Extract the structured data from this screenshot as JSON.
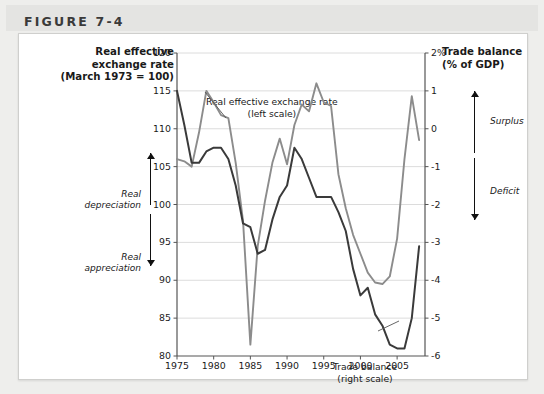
{
  "figure": {
    "label": "FIGURE 7-4"
  },
  "axis_titles": {
    "left_line1": "Real effective",
    "left_line2": "exchange rate",
    "left_line3": "(March 1973 = 100)",
    "right_line1": "Trade balance",
    "right_line2": "(% of GDP)"
  },
  "annotations": {
    "real_depreciation_line1": "Real",
    "real_depreciation_line2": "depreciation",
    "real_appreciation_line1": "Real",
    "real_appreciation_line2": "appreciation",
    "surplus": "Surplus",
    "deficit": "Deficit",
    "up-arrow-icon": "up-arrow-icon",
    "down-arrow-icon": "down-arrow-icon"
  },
  "callouts": {
    "reer_line1": "Real effective exchange rate",
    "reer_line2": "(left scale)",
    "trade_line1": "Trade balance",
    "trade_line2": "(right scale)"
  },
  "colors": {
    "reer_line": "#8c8c8c",
    "trade_line": "#3a3a3a",
    "gridline": "#dcdcdc",
    "axis": "#555555",
    "card_bg": "#ffffff",
    "page_bg": "#eeeeec",
    "header_bg": "#e4e4e2"
  },
  "chart_data": {
    "type": "line",
    "title": "",
    "xlabel": "",
    "grid": true,
    "legend": "callout-labels",
    "x_ticks": [
      1975,
      1980,
      1985,
      1990,
      1995,
      2000,
      2005
    ],
    "xlim": [
      1975,
      2008.8
    ],
    "left_axis": {
      "label": "Real effective exchange rate (March 1973 = 100)",
      "ylim": [
        80,
        120
      ],
      "ticks": [
        80,
        85,
        90,
        95,
        100,
        105,
        110,
        115,
        120
      ],
      "tick_labels": [
        "80",
        "85",
        "90",
        "95",
        "100",
        "105",
        "110",
        "115",
        "120"
      ]
    },
    "right_axis": {
      "label": "Trade balance (% of GDP)",
      "ylim": [
        -6,
        2
      ],
      "ticks": [
        -6,
        -5,
        -4,
        -3,
        -2,
        -1,
        0,
        1,
        2
      ],
      "tick_labels": [
        "-6",
        "-5",
        "-4",
        "-3",
        "-2",
        "-1",
        "0",
        "1",
        "2%"
      ]
    },
    "series": [
      {
        "name": "Real effective exchange rate (left scale)",
        "axis": "left",
        "color": "#8c8c8c",
        "x": [
          1975,
          1976,
          1977,
          1978,
          1979,
          1980,
          1981,
          1982,
          1983,
          1984,
          1985,
          1986,
          1987,
          1988,
          1989,
          1990,
          1991,
          1992,
          1993,
          1994,
          1995,
          1996,
          1997,
          1998,
          1999,
          2000,
          2001,
          2002,
          2003,
          2004,
          2005,
          2006,
          2007,
          2008
        ],
        "values": [
          106.0,
          105.7,
          105.0,
          109.5,
          115.0,
          113.5,
          111.8,
          111.4,
          105.5,
          97.8,
          81.5,
          94.5,
          100.5,
          105.5,
          108.7,
          105.3,
          110.5,
          113.2,
          112.3,
          116.0,
          113.5,
          113.0,
          104.0,
          99.5,
          96.0,
          93.5,
          91.0,
          89.7,
          89.5,
          90.5,
          95.5,
          106.0,
          114.3,
          108.5
        ]
      },
      {
        "name": "Trade balance (right scale)",
        "axis": "right",
        "color": "#3a3a3a",
        "x": [
          1975,
          1976,
          1977,
          1978,
          1979,
          1980,
          1981,
          1982,
          1983,
          1984,
          1985,
          1986,
          1987,
          1988,
          1989,
          1990,
          1991,
          1992,
          1993,
          1994,
          1995,
          1996,
          1997,
          1998,
          1999,
          2000,
          2001,
          2002,
          2003,
          2004,
          2005,
          2006,
          2007,
          2008
        ],
        "values": [
          1.0,
          0.1,
          -0.9,
          -0.9,
          -0.6,
          -0.5,
          -0.5,
          -0.8,
          -1.5,
          -2.5,
          -2.6,
          -3.3,
          -3.2,
          -2.4,
          -1.8,
          -1.5,
          -0.5,
          -0.8,
          -1.3,
          -1.8,
          -1.8,
          -1.8,
          -2.2,
          -2.7,
          -3.7,
          -4.4,
          -4.2,
          -4.9,
          -5.2,
          -5.7,
          -5.8,
          -5.8,
          -5.0,
          -3.1
        ]
      }
    ]
  }
}
